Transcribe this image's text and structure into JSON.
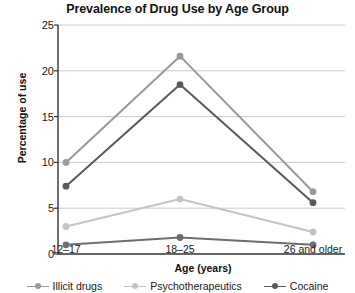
{
  "chart_data": {
    "type": "line",
    "title": "Prevalence of Drug Use by Age Group",
    "xlabel": "Age (years)",
    "ylabel": "Percentage of use",
    "categories": [
      "12–17",
      "18–25",
      "26 and older"
    ],
    "yticks": [
      0,
      5,
      10,
      15,
      20,
      25
    ],
    "ytick_labels": [
      "0",
      "5",
      "10",
      "15",
      "20",
      "25"
    ],
    "ylim": [
      0,
      25
    ],
    "grid": "horizontal",
    "legend_position": "bottom",
    "series": [
      {
        "name": "Illicit drugs",
        "color": "#999999",
        "values": [
          10.0,
          21.6,
          6.8
        ],
        "in_legend": true
      },
      {
        "name": "Psychotherapeutics",
        "color": "#c4c4c4",
        "values": [
          3.0,
          6.0,
          2.4
        ],
        "in_legend": true
      },
      {
        "name": "Cocaine",
        "color": "#595959",
        "values": [
          7.4,
          18.5,
          5.6
        ],
        "in_legend": true
      },
      {
        "name": "",
        "color": "#6e6e6e",
        "values": [
          1.0,
          1.8,
          1.0
        ],
        "in_legend": false
      }
    ]
  },
  "axes": {
    "spine_color": "#333333",
    "grid_color": "#cccccc"
  }
}
